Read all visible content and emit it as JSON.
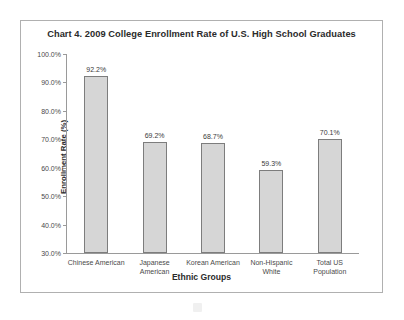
{
  "chart_data": {
    "type": "bar",
    "title": "Chart 4. 2009 College Enrollment Rate of U.S. High School Graduates",
    "xlabel": "Ethnic Groups",
    "ylabel": "Enrollment Rate (%)",
    "categories": [
      "Chinese American",
      "Japanese American",
      "Korean American",
      "Non-Hispanic White",
      "Total US Population"
    ],
    "category_lines": [
      [
        "Chinese American"
      ],
      [
        "Japanese",
        "American"
      ],
      [
        "Korean American"
      ],
      [
        "Non-Hispanic",
        "White"
      ],
      [
        "Total US",
        "Population"
      ]
    ],
    "values": [
      92.2,
      69.2,
      68.7,
      59.3,
      70.1
    ],
    "value_labels": [
      "92.2%",
      "69.2%",
      "68.7%",
      "59.3%",
      "70.1%"
    ],
    "ylim": [
      30.0,
      100.0
    ],
    "ytick_values": [
      100.0,
      90.0,
      80.0,
      70.0,
      60.0,
      50.0,
      40.0,
      30.0
    ],
    "ytick_labels": [
      "100.0%",
      "90.0%",
      "80.0%",
      "70.0%",
      "60.0%",
      "50.0%",
      "40.0%",
      "30.0%"
    ],
    "grid": false,
    "legend": false,
    "bar_fill_color": "#d6d6d6",
    "bar_border_color": "#7d7d7d",
    "axis_color": "#9a9a9a",
    "frame_border_color": "#b0b0b0",
    "background_color": "#ffffff"
  }
}
